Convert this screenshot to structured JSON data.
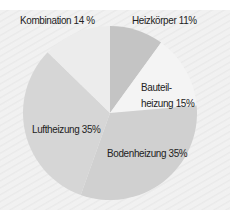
{
  "chart_data": {
    "type": "pie",
    "title": "",
    "slices": [
      {
        "label": "Heizkörper",
        "value": 11,
        "display": "Heizkörper 11%",
        "color": "#c4c4c4"
      },
      {
        "label": "Bauteilheizung",
        "value": 15,
        "display_line1": "Bauteil-",
        "display_line2": "heizung 15%",
        "color": "#f4f4f4"
      },
      {
        "label": "Bodenheizung",
        "value": 35,
        "display": "Bodenheizung 35%",
        "color": "#d0d0d0"
      },
      {
        "label": "Luftheizung",
        "value": 35,
        "display": "Luftheizung 35%",
        "color": "#d6d6d6"
      },
      {
        "label": "Kombination",
        "value": 14,
        "display": "Kombination 14 %",
        "color": "#ececec"
      }
    ],
    "start_angle_deg": 0,
    "direction": "clockwise",
    "legend": "none (labels on slices)"
  }
}
